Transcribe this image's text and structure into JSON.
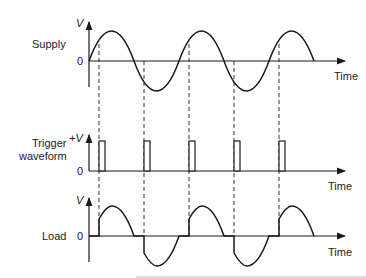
{
  "diagram": {
    "panels": [
      {
        "id": "supply",
        "label": "Supply",
        "y_axis_label": "V",
        "zero_label": "0",
        "x_axis_label": "Time"
      },
      {
        "id": "trigger",
        "label_line1": "Trigger",
        "label_line2": "waveform",
        "y_axis_label": "+V",
        "zero_label": "0",
        "x_axis_label": "Time"
      },
      {
        "id": "load",
        "label": "Load",
        "y_axis_label": "V",
        "zero_label": "0",
        "x_axis_label": "Time"
      }
    ],
    "trigger_pulse_count": 5,
    "colors": {
      "line": "#1a1a1a",
      "background": "#ffffff"
    }
  }
}
